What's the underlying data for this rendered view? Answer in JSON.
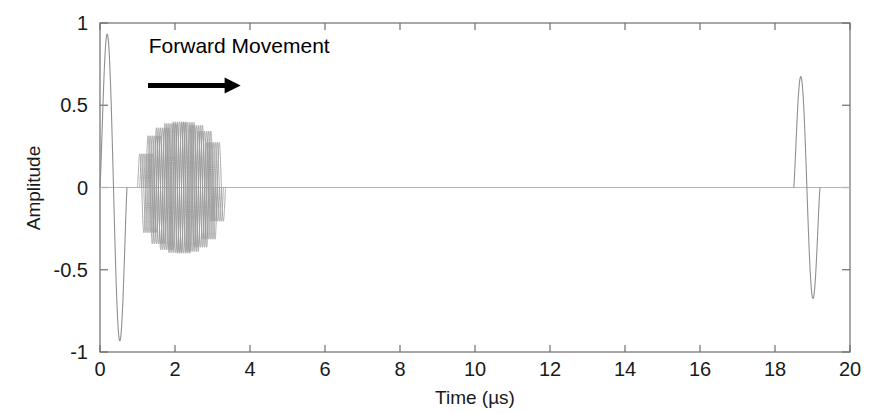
{
  "chart_data": {
    "type": "line",
    "title": "",
    "xlabel": "Time (µs)",
    "ylabel": "Amplitude",
    "xlim": [
      0,
      20
    ],
    "ylim": [
      -1,
      1
    ],
    "xticks": [
      0,
      2,
      4,
      6,
      8,
      10,
      12,
      14,
      16,
      18,
      20
    ],
    "xticklabels": [
      "0",
      "2",
      "4",
      "6",
      "8",
      "10",
      "12",
      "14",
      "16",
      "18",
      "20"
    ],
    "yticks": [
      -1,
      -0.5,
      0,
      0.5,
      1
    ],
    "yticklabels": [
      "-1",
      "-0.5",
      "0",
      "0.5",
      "1"
    ],
    "grid": false,
    "legend": "none",
    "line_color": "#8a8a8a",
    "axis_color": "#6e6e6e",
    "annotations": [
      {
        "name": "forward-movement-label",
        "text": "Forward Movement",
        "x": 1.3,
        "y": 0.82
      },
      {
        "name": "forward-movement-arrow",
        "text": "→",
        "x_start": 1.28,
        "x_end": 3.75,
        "y": 0.62
      }
    ],
    "series": [
      {
        "name": "excitation-pulse",
        "description": "Initial single-cycle transmit pulse",
        "t_start": 0.0,
        "t_end": 0.72,
        "peak_positive": 1.0,
        "peak_negative": -1.0,
        "cycles": 1
      },
      {
        "name": "propagating-wave-packet-family",
        "description": "Overlaid phase-shifted sinusoidal tone bursts showing forward movement",
        "t_start": 1.0,
        "t_end": 3.35,
        "peak_positive": 0.4,
        "peak_negative": -0.4,
        "cycles_per_burst": 9,
        "trace_count": 7,
        "trace_time_offsets": [
          0.0,
          0.055,
          0.11,
          0.165,
          0.22,
          0.275,
          0.33
        ]
      },
      {
        "name": "received-echo-pulse",
        "description": "Reflected echo arriving at far end of record",
        "t_start": 18.5,
        "t_end": 19.2,
        "peak_positive": 0.73,
        "peak_negative": -0.73,
        "cycles": 1
      }
    ],
    "baseline_value": 0
  }
}
